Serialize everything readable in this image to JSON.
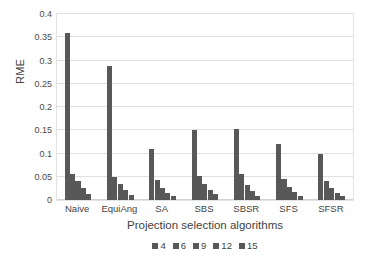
{
  "chart_data": {
    "type": "bar",
    "title": "",
    "xlabel": "Projection selection algorithms",
    "ylabel": "RME",
    "categories": [
      "Naive",
      "EquiAng",
      "SA",
      "SBS",
      "SBSR",
      "SFS",
      "SFSR"
    ],
    "series": [
      {
        "name": "4",
        "values": [
          0.36,
          0.288,
          0.11,
          0.15,
          0.152,
          0.12,
          0.1
        ]
      },
      {
        "name": "6",
        "values": [
          0.055,
          0.05,
          0.042,
          0.052,
          0.055,
          0.045,
          0.04
        ]
      },
      {
        "name": "9",
        "values": [
          0.04,
          0.034,
          0.026,
          0.034,
          0.032,
          0.028,
          0.026
        ]
      },
      {
        "name": "12",
        "values": [
          0.026,
          0.022,
          0.015,
          0.022,
          0.02,
          0.017,
          0.016
        ]
      },
      {
        "name": "15",
        "values": [
          0.012,
          0.01,
          0.008,
          0.012,
          0.009,
          0.009,
          0.008
        ]
      }
    ],
    "ylim": [
      0,
      0.4
    ],
    "yticks": [
      "0",
      "0.05",
      "0.1",
      "0.15",
      "0.2",
      "0.25",
      "0.3",
      "0.35",
      "0.4"
    ],
    "ytick_values": [
      0,
      0.05,
      0.1,
      0.15,
      0.2,
      0.25,
      0.3,
      0.35,
      0.4
    ],
    "grid": true,
    "legend_position": "bottom",
    "bar_color": "#585858",
    "grid_color": "#e0e0e0",
    "plot_border_color": "#e3e3e3",
    "background": "#ffffff"
  }
}
